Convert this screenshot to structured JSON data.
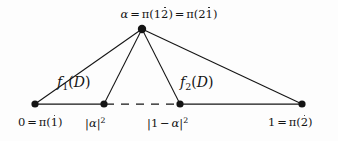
{
  "figure": {
    "background_color": "#fdfdfd",
    "ink_color": "#141414"
  },
  "apex": {
    "label_text": "α = π(12̇) = π(21̇)",
    "symbol": "α",
    "equals": "=",
    "pi": "π",
    "open_paren": "(",
    "close_paren": ")",
    "first_code_plain": "1",
    "first_code_dotted": "2",
    "second_code_plain": "2",
    "second_code_dotted": "1"
  },
  "nodes": [
    {
      "id": "node-0",
      "x": 35,
      "y": 104,
      "r": 3.6,
      "label": "0 = π(1̇)"
    },
    {
      "id": "node-alpha-sq",
      "x": 104,
      "y": 104,
      "r": 3.6,
      "label": "|α|²"
    },
    {
      "id": "node-one-minus",
      "x": 180,
      "y": 104,
      "r": 3.6,
      "label": "|1 − α|²"
    },
    {
      "id": "node-1",
      "x": 302,
      "y": 104,
      "r": 3.6,
      "label": "1 = π(2̇)"
    },
    {
      "id": "node-apex",
      "x": 142,
      "y": 29,
      "r": 4.2,
      "label": "α = π(12̇) = π(21̇)"
    }
  ],
  "bottom_labels": {
    "left": {
      "value": "0",
      "equals": "=",
      "pi": "π",
      "open_paren": "(",
      "code_dotted": "1",
      "close_paren": ")"
    },
    "alpha_sq": {
      "bar_open": "|",
      "symbol": "α",
      "bar_close": "|",
      "exponent": "2"
    },
    "one_minus_alpha_sq": {
      "bar_open": "|",
      "one": "1",
      "minus": "−",
      "symbol": "α",
      "bar_close": "|",
      "exponent": "2"
    },
    "right": {
      "value": "1",
      "equals": "=",
      "pi": "π",
      "open_paren": "(",
      "code_dotted": "2",
      "close_paren": ")"
    }
  },
  "region_labels": [
    {
      "id": "f1",
      "function": "f",
      "subscript": "1",
      "open_paren": "(",
      "argument": "D",
      "close_paren": ")",
      "text": "f₁(D)"
    },
    {
      "id": "f2",
      "function": "f",
      "subscript": "2",
      "open_paren": "(",
      "argument": "D",
      "close_paren": ")",
      "text": "f₂(D)"
    }
  ],
  "edges": [
    {
      "id": "edge-apex-to-node0",
      "from": "node-apex",
      "to": "node-0",
      "style": "solid"
    },
    {
      "id": "edge-apex-to-alpha-sq",
      "from": "node-apex",
      "to": "node-alpha-sq",
      "style": "solid"
    },
    {
      "id": "edge-apex-to-one-minus",
      "from": "node-apex",
      "to": "node-one-minus",
      "style": "solid"
    },
    {
      "id": "edge-apex-to-node1",
      "from": "node-apex",
      "to": "node-1",
      "style": "solid"
    },
    {
      "id": "edge-base-left",
      "from": "node-0",
      "to": "node-alpha-sq",
      "style": "solid"
    },
    {
      "id": "edge-base-middle",
      "from": "node-alpha-sq",
      "to": "node-one-minus",
      "style": "dashed"
    },
    {
      "id": "edge-base-right",
      "from": "node-one-minus",
      "to": "node-1",
      "style": "solid"
    }
  ]
}
